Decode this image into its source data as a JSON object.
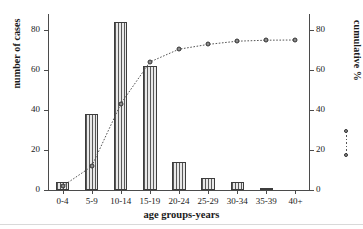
{
  "chart_data": {
    "type": "bar",
    "title": "",
    "subtitle": "",
    "xlabel": "age groups-years",
    "ylabel": "number of cases",
    "y2label": "cumulative %",
    "categories": [
      "0-4",
      "5-9",
      "10-14",
      "15-19",
      "20-24",
      "25-29",
      "30-34",
      "35-39",
      "40+"
    ],
    "values": [
      4,
      38,
      84,
      62,
      14,
      6,
      4,
      1,
      0
    ],
    "ylim": [
      0,
      88
    ],
    "yticks": [
      0,
      20,
      40,
      60,
      80
    ],
    "yticklabels": [
      "0",
      "20",
      "40",
      "60",
      "80"
    ],
    "y2lim": [
      0,
      88
    ],
    "y2ticks": [
      0,
      20,
      40,
      60,
      80
    ],
    "y2ticklabels": [
      "0",
      "20",
      "40",
      "60",
      "80"
    ],
    "grid": false,
    "legend": "none",
    "series": [
      {
        "name": "number of cases",
        "type": "bar",
        "axis": "left",
        "values": [
          4,
          38,
          84,
          62,
          14,
          6,
          4,
          1,
          0
        ]
      },
      {
        "name": "cumulative %",
        "type": "line",
        "axis": "right",
        "marker": "circle",
        "linestyle": "dotted",
        "values": [
          1.9,
          11.8,
          43.1,
          64.0,
          70.4,
          72.8,
          74.4,
          74.9,
          75.0
        ]
      }
    ],
    "colors": {
      "bar_fill": "#d6d6d6",
      "bar_hatch": "#595959",
      "bar_edge": "#3d3d3d",
      "line": "#555555",
      "marker": "#8a8a8a",
      "axis": "#4b4b4b",
      "text": "#1a1a1a",
      "background": "#ffffff"
    }
  },
  "axes": {
    "left_title": "number of cases",
    "right_title": "cumulative %",
    "x_title": "age groups-years"
  }
}
